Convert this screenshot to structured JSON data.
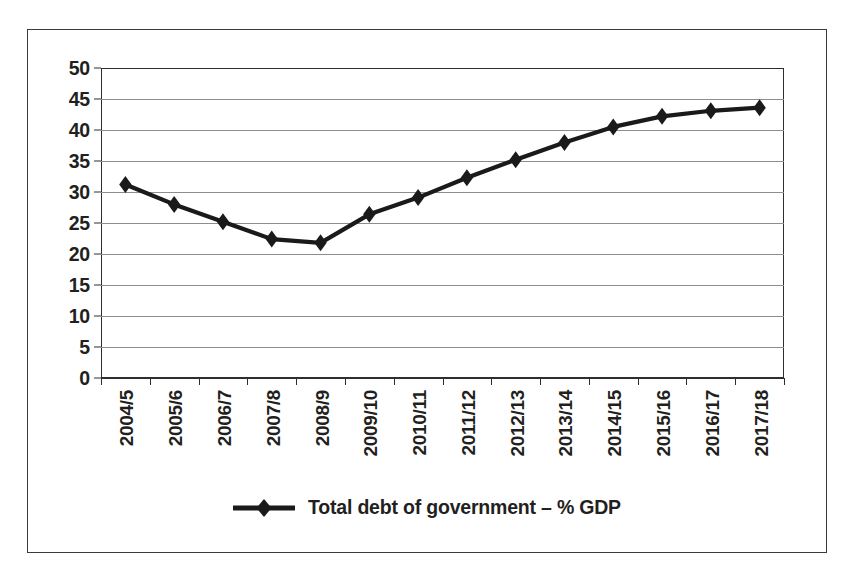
{
  "chart_data": {
    "type": "line",
    "title": "",
    "xlabel": "",
    "ylabel": "",
    "ylim": [
      0,
      50
    ],
    "ytick_step": 5,
    "yticks": [
      "0",
      "5",
      "10",
      "15",
      "20",
      "25",
      "30",
      "35",
      "40",
      "45",
      "50"
    ],
    "grid": true,
    "legend_position": "bottom",
    "categories": [
      "2004/5",
      "2005/6",
      "2006/7",
      "2007/8",
      "2008/9",
      "2009/10",
      "2010/11",
      "2011/12",
      "2012/13",
      "2013/14",
      "2014/15",
      "2015/16",
      "2016/17",
      "2017/18"
    ],
    "series": [
      {
        "name": "Total debt of government – % GDP",
        "marker": "diamond",
        "color": "#1a1a1a",
        "values": [
          31.2,
          28.0,
          25.2,
          22.4,
          21.8,
          26.4,
          29.1,
          32.3,
          35.2,
          38.0,
          40.5,
          42.2,
          43.1,
          43.6
        ]
      }
    ]
  },
  "legend": {
    "marker_name": "diamond-marker",
    "label": "Total debt of government – % GDP"
  },
  "colors": {
    "series": "#1a1a1a",
    "axis": "#2e2e2e",
    "gridline": "#8d8d8d",
    "text": "#231f20",
    "border": "#3b3b3b",
    "background": "#ffffff"
  }
}
